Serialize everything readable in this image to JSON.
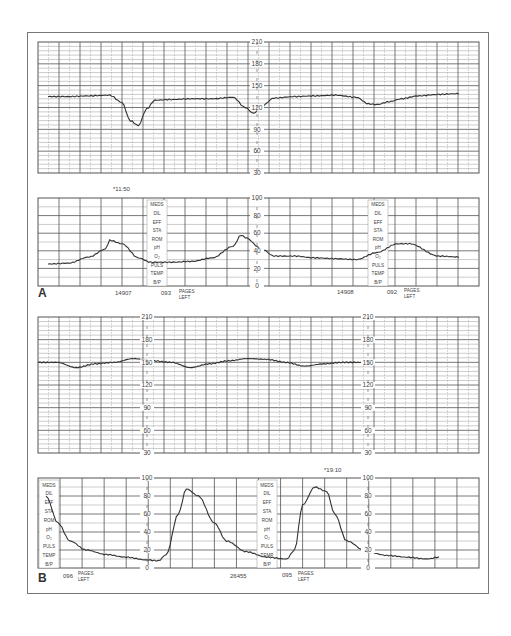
{
  "figure": {
    "panel_labels": [
      "A",
      "B"
    ],
    "chart_column_labels": [
      "MEDS",
      "DIL",
      "EFF",
      "STA",
      "ROM",
      "pH",
      "O2",
      "PULS",
      "TEMP",
      "B/P"
    ],
    "pages_left_label": [
      "PAGES",
      "LEFT"
    ]
  },
  "strip_a": {
    "time_mark": "*11:50",
    "fhr_ticks": [
      "210",
      "180",
      "150",
      "120",
      "90",
      "60",
      "30"
    ],
    "uc_ticks": [
      "100",
      "80",
      "60",
      "40",
      "20",
      "0"
    ],
    "footer": [
      {
        "text": "14907"
      },
      {
        "text": "093"
      },
      {
        "text": "14908"
      },
      {
        "text": "092"
      }
    ]
  },
  "strip_b": {
    "time_mark": "*19:10",
    "fhr_ticks": [
      "210",
      "180",
      "150",
      "120",
      "90",
      "60",
      "30"
    ],
    "uc_ticks": [
      "100",
      "80",
      "60",
      "40",
      "20",
      "0"
    ],
    "footer": [
      {
        "text": "096"
      },
      {
        "text": "26455"
      },
      {
        "text": "095"
      }
    ]
  },
  "colors": {
    "grid_major": "#555555",
    "grid_minor": "#999999",
    "trace": "#333333",
    "frame": "#777777"
  },
  "chart_data": [
    {
      "type": "line",
      "title": "Strip A — Fetal heart rate",
      "ylabel": "FHR (bpm)",
      "ylim": [
        30,
        210
      ],
      "yticks": [
        210,
        180,
        150,
        120,
        90,
        60,
        30
      ],
      "x": [
        0,
        5,
        10,
        15,
        18,
        20,
        22,
        24,
        26,
        30,
        35,
        40,
        45,
        48,
        50,
        52,
        55,
        60,
        65,
        70,
        75,
        78,
        80,
        83,
        86,
        90,
        95,
        100
      ],
      "values": [
        135,
        135,
        136,
        137,
        127,
        102,
        95,
        118,
        130,
        131,
        132,
        132,
        134,
        120,
        112,
        122,
        133,
        135,
        136,
        137,
        134,
        125,
        124,
        128,
        132,
        136,
        138,
        139
      ],
      "annotations": [
        "Late decelerations following contractions"
      ]
    },
    {
      "type": "line",
      "title": "Strip A — Uterine activity",
      "ylabel": "mm Hg",
      "ylim": [
        0,
        100
      ],
      "yticks": [
        100,
        80,
        60,
        40,
        20,
        0
      ],
      "x": [
        0,
        5,
        10,
        14,
        15,
        18,
        22,
        25,
        30,
        35,
        40,
        45,
        47,
        48,
        52,
        55,
        60,
        65,
        70,
        75,
        80,
        85,
        88,
        95,
        100
      ],
      "values": [
        25,
        26,
        33,
        42,
        52,
        48,
        32,
        27,
        27,
        28,
        32,
        45,
        58,
        55,
        42,
        34,
        34,
        32,
        31,
        30,
        38,
        48,
        48,
        34,
        33
      ],
      "time_mark": "*11:50"
    },
    {
      "type": "line",
      "title": "Strip B — Fetal heart rate",
      "ylabel": "FHR (bpm)",
      "ylim": [
        30,
        210
      ],
      "yticks": [
        210,
        180,
        150,
        120,
        90,
        60,
        30
      ],
      "x": [
        0,
        5,
        10,
        15,
        20,
        25,
        30,
        35,
        40,
        45,
        50,
        55,
        60,
        65,
        70,
        75,
        80,
        85
      ],
      "values": [
        150,
        150,
        143,
        148,
        150,
        155,
        152,
        150,
        143,
        148,
        152,
        155,
        154,
        150,
        145,
        148,
        150,
        150
      ],
      "annotations": [
        "Baseline ~150 bpm with mild variable dips"
      ]
    },
    {
      "type": "line",
      "title": "Strip B — Uterine activity",
      "ylabel": "mm Hg",
      "ylim": [
        0,
        100
      ],
      "yticks": [
        100,
        80,
        60,
        40,
        20,
        0
      ],
      "x": [
        0,
        3,
        6,
        10,
        15,
        20,
        25,
        28,
        30,
        33,
        35,
        38,
        42,
        45,
        50,
        55,
        60,
        62,
        64,
        67,
        70,
        72,
        75,
        80,
        85,
        90,
        95,
        98
      ],
      "values": [
        80,
        50,
        30,
        20,
        15,
        12,
        9,
        8,
        15,
        60,
        88,
        80,
        50,
        30,
        18,
        12,
        10,
        20,
        70,
        90,
        85,
        60,
        30,
        18,
        14,
        12,
        10,
        12
      ],
      "time_mark": "*19:10",
      "annotations": [
        "High-amplitude contractions peaking ~90 mm Hg"
      ]
    }
  ]
}
